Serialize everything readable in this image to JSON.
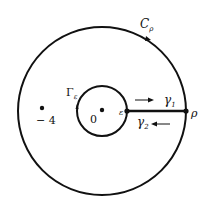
{
  "diagram": {
    "type": "contour-integration-keyhole",
    "colors": {
      "stroke": "#111111",
      "background": "#ffffff"
    },
    "outer_contour": {
      "label": "C",
      "label_sub": "ρ",
      "cx": 102,
      "cy": 111,
      "r": 84
    },
    "inner_contour": {
      "label": "Γ",
      "label_sub": "ε",
      "cx": 102,
      "cy": 111,
      "r": 25
    },
    "segment": {
      "from_label": "ε",
      "to_label": "ρ",
      "x1": 127,
      "x2": 186,
      "y": 111
    },
    "paths": [
      {
        "label": "γ",
        "sub": "1",
        "direction": "right"
      },
      {
        "label": "γ",
        "sub": "2",
        "direction": "left"
      }
    ],
    "points": [
      {
        "label": "0",
        "x": 102,
        "y": 110
      },
      {
        "label": "− 4",
        "x": 42,
        "y": 108
      }
    ]
  }
}
